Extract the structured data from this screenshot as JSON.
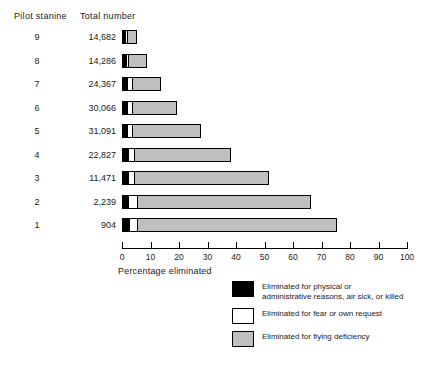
{
  "headers": {
    "stanine": "Pilot stanine",
    "total": "Total number"
  },
  "axis_title": "Percentage eliminated",
  "legend": [
    {
      "swatch": "black",
      "line1": "Eliminated for physical or",
      "line2": "administrative reasons, air sick, or killed"
    },
    {
      "swatch": "white",
      "line1": "Eliminated for fear or own request",
      "line2": ""
    },
    {
      "swatch": "gray",
      "line1": "Eliminated for flying deficiency",
      "line2": ""
    }
  ],
  "colors": {
    "physical": "#000000",
    "fear": "#ffffff",
    "flying_deficiency": "#bfbfbf",
    "outline": "#000000"
  },
  "chart_data": {
    "type": "bar",
    "orientation": "horizontal",
    "stacked": true,
    "title": "",
    "xlabel": "Percentage eliminated",
    "ylabel": "Pilot stanine",
    "xlim": [
      0,
      100
    ],
    "xticks": [
      0,
      10,
      20,
      30,
      40,
      50,
      60,
      70,
      80,
      90,
      100
    ],
    "grid": false,
    "legend_position": "bottom-right",
    "categories": [
      "9",
      "8",
      "7",
      "6",
      "5",
      "4",
      "3",
      "2",
      "1"
    ],
    "totals": [
      "14,682",
      "14,286",
      "24,367",
      "30,066",
      "31,091",
      "22,827",
      "11,471",
      "2,239",
      "904"
    ],
    "series": [
      {
        "name": "Eliminated for physical or administrative reasons, air sick, or killed",
        "color": "#000000",
        "values": [
          1.4,
          1.4,
          1.8,
          1.8,
          1.8,
          2.1,
          2.1,
          2.1,
          2.5
        ]
      },
      {
        "name": "Eliminated for fear or own request",
        "color": "#ffffff",
        "values": [
          0.7,
          1.0,
          1.7,
          1.7,
          1.7,
          2.1,
          2.1,
          3.2,
          2.8
        ]
      },
      {
        "name": "Eliminated for flying deficiency",
        "color": "#bfbfbf",
        "values": [
          3.2,
          6.4,
          10.2,
          15.8,
          24.2,
          34.0,
          47.4,
          61.0,
          70.1
        ]
      }
    ],
    "totals_eliminated_pct": [
      5.3,
      8.8,
      13.7,
      19.3,
      27.7,
      38.2,
      51.6,
      66.3,
      75.4
    ]
  }
}
